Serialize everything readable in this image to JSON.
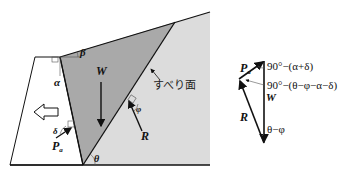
{
  "colors": {
    "soil_light": "#dcdcdc",
    "wedge": "#a9a9a9",
    "line": "#111111",
    "wall_fill": "#ffffff"
  },
  "diagram": {
    "labels": {
      "weight": "W",
      "reaction": "R",
      "earth_pressure": "P",
      "earth_pressure_sub": "a",
      "slip_surface": "すべり面",
      "alpha": "α",
      "beta": "β",
      "delta": "δ",
      "phi": "φ",
      "theta": "θ"
    }
  },
  "force_polygon": {
    "labels": {
      "pa": "P",
      "pa_sub": "a",
      "w": "W",
      "r": "R",
      "angle_top": "90°−(α+δ)",
      "angle_mid": "90°−(θ−φ−α−δ)",
      "angle_bottom": "θ−φ"
    }
  }
}
